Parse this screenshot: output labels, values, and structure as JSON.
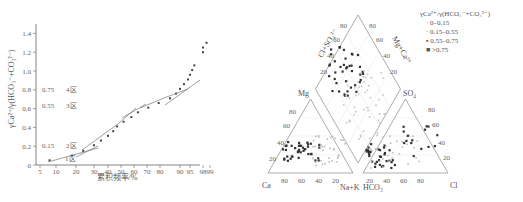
{
  "chart_data": [
    {
      "type": "scatter",
      "title": "",
      "xlabel": "累积频率/%",
      "ylabel": "γCa/γ(HCO3+CO3)",
      "x_ticks": [
        "5",
        "10",
        "20",
        "30",
        "40",
        "50",
        "60",
        "70",
        "80",
        "90",
        "95",
        "98",
        "99"
      ],
      "y_ticks": [
        "0",
        "0.2",
        "0.4",
        "0.6",
        "0.8",
        "1.0",
        "1.2",
        "1.4"
      ],
      "ylim": [
        0,
        1.5
      ],
      "grid": false,
      "annotations": [
        {
          "text": "0.75",
          "zone": "4区",
          "y": 0.75
        },
        {
          "text": "0.55",
          "zone": "3区",
          "y": 0.55
        },
        {
          "text": "0.15",
          "zone": "2区",
          "y": 0.15
        },
        {
          "text": "",
          "zone": "1区",
          "y": 0.03
        }
      ],
      "series": [
        {
          "name": "cumulative probability points",
          "points": [
            [
              8,
              0.05
            ],
            [
              18,
              0.1
            ],
            [
              24,
              0.15
            ],
            [
              30,
              0.21
            ],
            [
              35,
              0.26
            ],
            [
              40,
              0.31
            ],
            [
              44,
              0.36
            ],
            [
              47,
              0.41
            ],
            [
              52,
              0.46
            ],
            [
              58,
              0.51
            ],
            [
              63,
              0.56
            ],
            [
              71,
              0.61
            ],
            [
              79,
              0.66
            ],
            [
              85,
              0.71
            ],
            [
              88,
              0.76
            ],
            [
              90,
              0.81
            ],
            [
              92,
              0.86
            ],
            [
              94,
              0.91
            ],
            [
              95,
              0.96
            ],
            [
              95.5,
              1.01
            ],
            [
              96,
              1.06
            ],
            [
              98,
              1.2
            ],
            [
              98,
              1.25
            ],
            [
              98.5,
              1.3
            ]
          ]
        }
      ]
    },
    {
      "type": "scatter",
      "title": "Piper diagram",
      "labels": {
        "left_triangle_apex": "Mg",
        "left_triangle_left": "Ca",
        "left_triangle_right": "Na+K",
        "right_triangle_apex": "SO4",
        "right_triangle_left": "HCO3",
        "right_triangle_right": "Cl",
        "diamond_left": "Cl+SO4",
        "diamond_right": "Mg+Ca"
      },
      "ticks": [
        "20",
        "40",
        "60",
        "80"
      ],
      "legend": {
        "title": "γCa/γ(HCO3+CO3)",
        "entries": [
          "0–0.15",
          "0.15–0.55",
          "0.55–0.75",
          ">0.75"
        ]
      }
    }
  ],
  "left_chart": {
    "ylabel": "γCa²⁺/γ(HCO₃⁻+CO₃²⁻)",
    "xlabel": "累积频率/%",
    "zones": [
      {
        "value": "0.75",
        "label": "4区"
      },
      {
        "value": "0.55",
        "label": "3区"
      },
      {
        "value": "0.15",
        "label": "2区"
      },
      {
        "value": "",
        "label": "1区"
      }
    ]
  },
  "piper": {
    "ca": "Ca",
    "mg": "Mg",
    "nak": "Na+K",
    "hco3": "HCO₃",
    "so4": "SO₄",
    "cl": "Cl",
    "clso4": "Cl+SO₄²⁻",
    "mgca": "Mg+Ca²⁺"
  },
  "legend": {
    "title": "γCa²⁺/γ(HCO₃⁻+CO₃²⁻)",
    "items": [
      "0–0.15",
      "0.15–0.55",
      "0.55–0.75",
      ">0.75"
    ]
  }
}
